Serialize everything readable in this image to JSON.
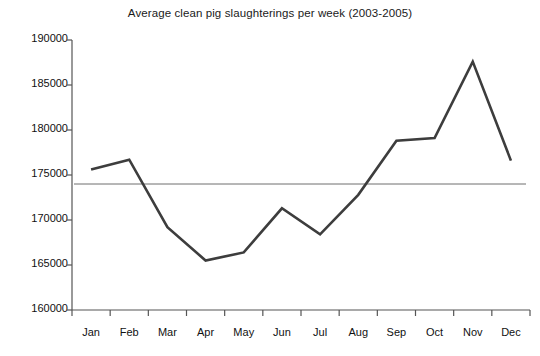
{
  "chart_data": {
    "type": "line",
    "title": "Average clean pig slaughterings per week (2003-2005)",
    "xlabel": "",
    "ylabel": "",
    "categories": [
      "Jan",
      "Feb",
      "Mar",
      "Apr",
      "May",
      "Jun",
      "Jul",
      "Aug",
      "Sep",
      "Oct",
      "Nov",
      "Dec"
    ],
    "series": [
      {
        "name": "Average clean pig slaughterings per week",
        "values": [
          175600,
          176700,
          169200,
          165500,
          166400,
          171300,
          168400,
          172800,
          178800,
          179100,
          187600,
          176600
        ],
        "color": "#3d3d3d",
        "line_width": 2.6
      },
      {
        "name": "Reference level",
        "type": "hline",
        "value": 174000,
        "color": "#6e6e6e",
        "line_width": 1
      }
    ],
    "ylim": [
      160000,
      190000
    ],
    "yticks": [
      160000,
      165000,
      170000,
      175000,
      180000,
      185000,
      190000
    ],
    "ytick_labels": [
      "160000",
      "165000",
      "170000",
      "175000",
      "180000",
      "185000",
      "190000"
    ],
    "grid": false,
    "legend": false,
    "axis_color": "#555555"
  }
}
